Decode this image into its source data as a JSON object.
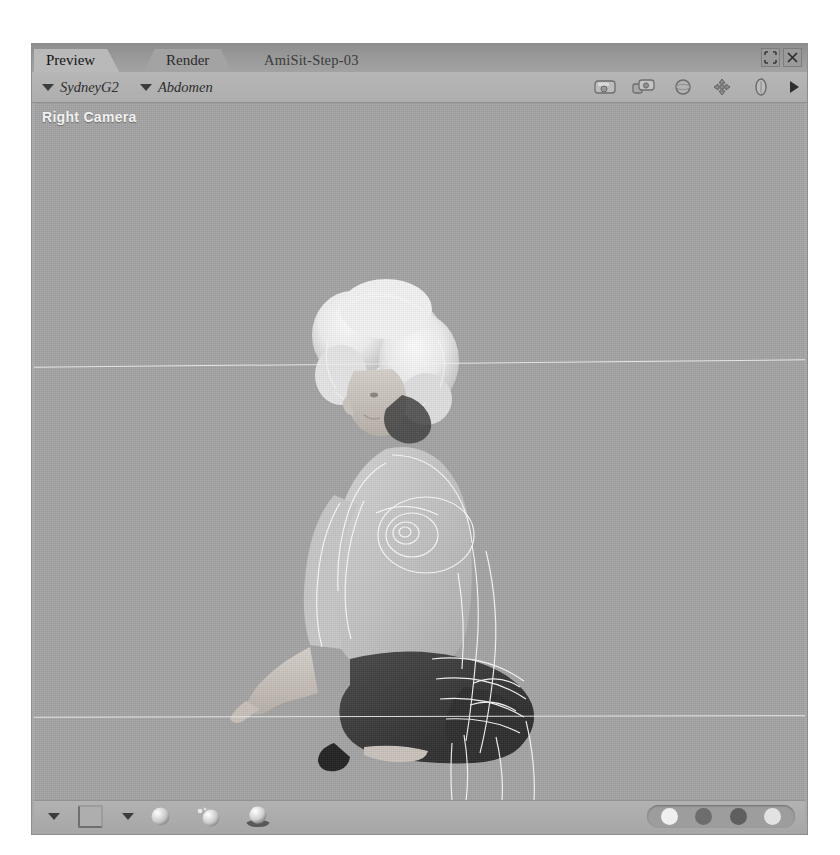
{
  "window": {
    "document_title": "AmiSit-Step-03",
    "tabs": [
      {
        "label": "Preview",
        "name": "tab-preview",
        "active": true
      },
      {
        "label": "Render",
        "name": "tab-render",
        "active": false
      }
    ],
    "controls": [
      {
        "name": "restore-button",
        "icon": "restore-icon",
        "label": "Restore"
      },
      {
        "name": "close-button",
        "icon": "close-icon",
        "label": "Close"
      }
    ]
  },
  "subtoolbar": {
    "figure_selector": {
      "label": "SydneyG2",
      "icon": "chevron-down-icon"
    },
    "body_part_selector": {
      "label": "Abdomen",
      "icon": "chevron-down-icon"
    },
    "icons": [
      {
        "name": "camera-view-icon",
        "label": "Camera View"
      },
      {
        "name": "camera-flyaround-icon",
        "label": "Fly Around View"
      },
      {
        "name": "sphere-orbit-icon",
        "label": "Orbit Camera"
      },
      {
        "name": "move-camera-icon",
        "label": "Pan Camera"
      },
      {
        "name": "dolly-camera-icon",
        "label": "Dolly Camera"
      },
      {
        "name": "play-arrow-icon",
        "label": "Next"
      }
    ]
  },
  "viewport": {
    "camera_label": "Right Camera",
    "background_color": "#a5a5a5",
    "guide_color": "#ececec",
    "guides": 2,
    "scene": {
      "subject": "seated female 3D figure with wireframe overlay",
      "pose": "crouching / sitting",
      "wireframe_color": "#ffffff"
    }
  },
  "bottombar": {
    "items": [
      {
        "name": "display-style-dropdown",
        "icon": "chevron-down-icon"
      },
      {
        "name": "bounding-box-button",
        "icon": "box-icon"
      },
      {
        "name": "figure-style-dropdown",
        "icon": "chevron-down-icon"
      },
      {
        "name": "smooth-shaded-button",
        "icon": "sphere-icon"
      },
      {
        "name": "texture-shaded-button",
        "icon": "sphere-textured-icon"
      },
      {
        "name": "cast-shadow-button",
        "icon": "sphere-shadow-icon"
      }
    ],
    "render_modes": [
      {
        "name": "mode-button-1",
        "color": "#efefef"
      },
      {
        "name": "mode-button-2",
        "color": "#6d6d6d"
      },
      {
        "name": "mode-button-3",
        "color": "#5f5f5f"
      },
      {
        "name": "mode-button-4",
        "color": "#e2e2e2"
      }
    ]
  }
}
